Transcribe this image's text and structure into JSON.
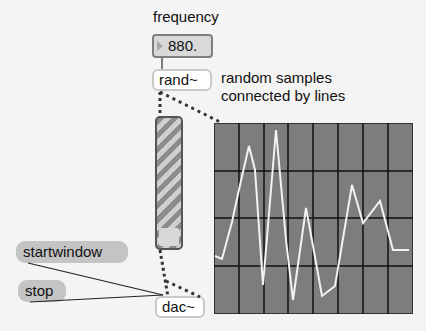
{
  "patch": {
    "frequency_label": "frequency",
    "frequency_value": "880.",
    "rand_object": "rand~",
    "comment_line1": "random samples",
    "comment_line2": "connected by lines",
    "startwindow_message": "startwindow",
    "stop_message": "stop",
    "dac_object": "dac~"
  },
  "scope": {
    "grid_cols": 8,
    "grid_rows": 4,
    "background": "#7d7d7d",
    "grid_color": "#111111",
    "trace_color": "#f2f2f2"
  },
  "colors": {
    "canvas": "#f4f4f4",
    "message_box": "#c4c4c4",
    "number_box": "#d9d9d9",
    "patch_cord_signal": "#333333"
  }
}
